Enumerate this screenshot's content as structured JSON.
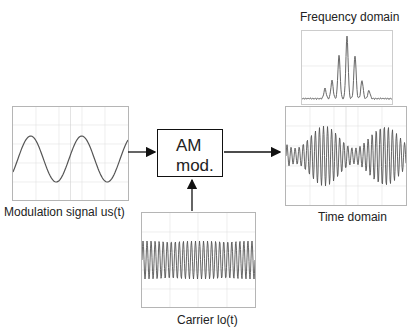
{
  "diagram": {
    "block": {
      "line1": "AM",
      "line2": "mod."
    },
    "modulation": {
      "label": "Modulation signal us(t)",
      "cycles": 2.25
    },
    "carrier": {
      "label": "Carrier lo(t)",
      "cycles": 28
    },
    "frequency": {
      "label": "Frequency domain"
    },
    "time": {
      "label": "Time domain"
    },
    "colors": {
      "trace": "#555555",
      "grid": "#dddddd",
      "frame": "#b5b5b5",
      "arrow": "#111111"
    }
  }
}
